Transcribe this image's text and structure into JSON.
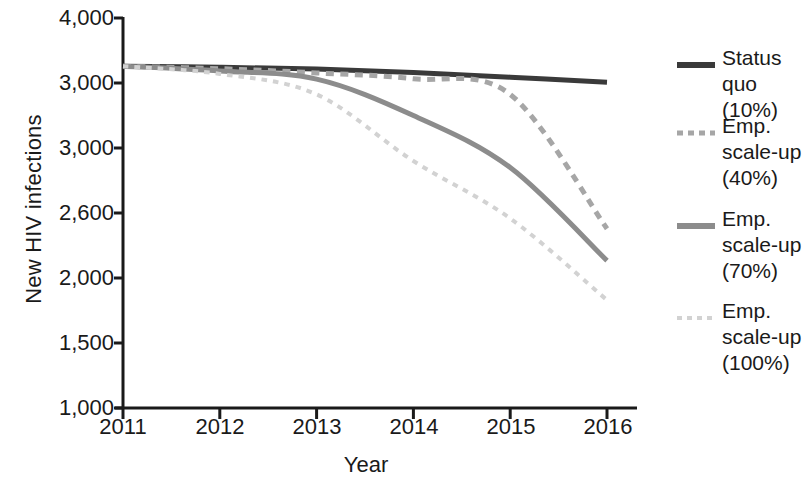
{
  "chart_data": {
    "type": "line",
    "title": "",
    "xlabel": "Year",
    "ylabel": "New HIV infections",
    "x": [
      2011,
      2012,
      2013,
      2014,
      2015,
      2016
    ],
    "xtick_labels": [
      "2011",
      "2012",
      "2013",
      "2014",
      "2015",
      "2016"
    ],
    "ytick_labels": [
      "4,000",
      "3,000",
      "3,000",
      "2,600",
      "2,000",
      "1,500",
      "1,000"
    ],
    "ytick_values": [
      4000,
      3000,
      3000,
      2600,
      2000,
      1500,
      1000
    ],
    "ylim": [
      1000,
      4000
    ],
    "xlim": [
      2011,
      2016
    ],
    "grid": false,
    "legend_position": "right",
    "series": [
      {
        "name": "Status quo (10%)",
        "label_lines": "Status\nquo (10%)",
        "style": "solid",
        "color": "#3a3a3a",
        "width": 5,
        "values": [
          3258,
          3243,
          3215,
          3160,
          3090,
          3010
        ]
      },
      {
        "name": "Emp. scale-up (40%)",
        "label_lines": "Emp.\nscale-up\n(40%)",
        "style": "dashed",
        "color": "#a6a6a6",
        "width": 5,
        "values": [
          3258,
          3220,
          3155,
          3065,
          2965,
          2455
        ]
      },
      {
        "name": "Emp. scale-up (70%)",
        "label_lines": "Emp.\nscale-up\n(70%)",
        "style": "solid",
        "color": "#8c8c8c",
        "width": 5,
        "values": [
          3258,
          3185,
          3060,
          2900,
          2740,
          2160
        ]
      },
      {
        "name": "Emp. scale-up (100%)",
        "label_lines": "Emp.\nscale-up\n(100%)",
        "style": "dotted",
        "color": "#d2d2d2",
        "width": 4,
        "values": [
          3258,
          3140,
          2965,
          2760,
          2550,
          1830
        ]
      }
    ]
  },
  "axes": {
    "line_color": "#1a1a1a",
    "line_width": 3
  }
}
